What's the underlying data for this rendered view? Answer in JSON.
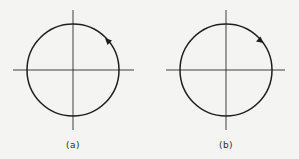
{
  "figure": {
    "panels": [
      {
        "id": "a",
        "label": "(a)",
        "direction": "counterclockwise",
        "center": [
          73,
          70
        ],
        "radius": 46,
        "arrow_position": [
          108,
          41
        ]
      },
      {
        "id": "b",
        "label": "(b)",
        "direction": "clockwise",
        "center": [
          226,
          70
        ],
        "radius": 46,
        "arrow_position": [
          260,
          40
        ]
      }
    ],
    "colors": {
      "stroke": "#1e1e1e",
      "background": "#f4f4f2"
    }
  }
}
